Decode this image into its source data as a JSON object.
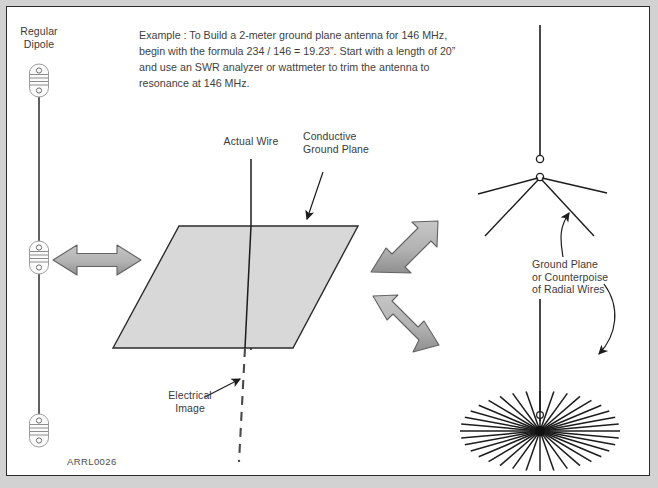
{
  "figure": {
    "id_label": "ARRL0026",
    "background_color": "#ffffff",
    "border_color": "#2b2b2b",
    "plane_fill": "#d8d8d8",
    "arrow_fill": "#b3b3b3",
    "line_color": "#1c1c1c"
  },
  "example_note": {
    "text": "Example : To Build a 2-meter ground plane antenna for 146 MHz, begin with the formula 234 / 146 = 19.23”. Start with a length of 20” and use an SWR analyzer or wattmeter to trim the antenna to resonance at 146 MHz.",
    "formula": "234 / 146 = 19.23”",
    "frequency": "146 MHz",
    "starting_length": "20”",
    "band": "2-meter"
  },
  "labels": {
    "regular_dipole": "Regular\nDipole",
    "actual_wire": "Actual Wire",
    "conductive_ground_plane": "Conductive\nGround Plane",
    "electrical_image": "Electrical\nImage",
    "ground_plane_counterpoise": "Ground Plane\nor Counterpoise\nof Radial Wires"
  },
  "elements": {
    "dipole_insulators": 3,
    "sloping_radials": 4,
    "radial_star_wires": 36,
    "arrows": [
      {
        "name": "dipole-to-plane-arrow",
        "direction": "horizontal-double"
      },
      {
        "name": "plane-to-groundplane-arrow-upper",
        "direction": "diagonal-up-double"
      },
      {
        "name": "plane-to-radials-arrow-lower",
        "direction": "diagonal-down-double"
      }
    ]
  }
}
